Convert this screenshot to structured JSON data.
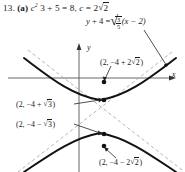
{
  "problem": {
    "number": "13.",
    "part": "(a)",
    "statement_plain": "c^2 = 3 + 5 = 8, c = 2√2",
    "c_squared_var": "c",
    "c_squared_exp": "2",
    "eq1_rhs": "3 + 5 = 8",
    "c_var": "c",
    "c_value_coeff": "2",
    "c_value_radicand": "2"
  },
  "asymptote_equation": {
    "lhs_var": "y",
    "lhs_rest": "+ 4 =",
    "frac_num": "3",
    "frac_den": "5",
    "factor": "(x − 2)",
    "plain": "y + 4 = √(3/5) (x − 2)"
  },
  "axes": {
    "y_label": "y",
    "x_label": "x",
    "origin_px": [
      79,
      78
    ]
  },
  "points": [
    {
      "id": "upper-outer",
      "plain": "(2, −4 + 2√2)",
      "prefix": "(2, −4 + 2",
      "radicand": "2",
      "suffix": ")",
      "dot_px": [
        104,
        82
      ]
    },
    {
      "id": "upper-inner",
      "plain": "(2, −4 + √3)",
      "prefix": "(2, −4 + ",
      "radicand": "3",
      "suffix": ")",
      "dot_px": [
        104,
        100
      ]
    },
    {
      "id": "lower-inner",
      "plain": "(2, −4 − √3)",
      "prefix": "(2, −4 − ",
      "radicand": "3",
      "suffix": ")",
      "dot_px": [
        104,
        134
      ]
    },
    {
      "id": "lower-outer",
      "plain": "(2, −4 − 2√2)",
      "prefix": "(2, −4 − 2",
      "radicand": "2",
      "suffix": ")",
      "dot_px": [
        104,
        146
      ]
    }
  ],
  "colors": {
    "ink": "#1a1a1a",
    "curve": "#111111",
    "axis": "#555555",
    "asymptote": "#9a9a9a",
    "background": "#ffffff"
  }
}
